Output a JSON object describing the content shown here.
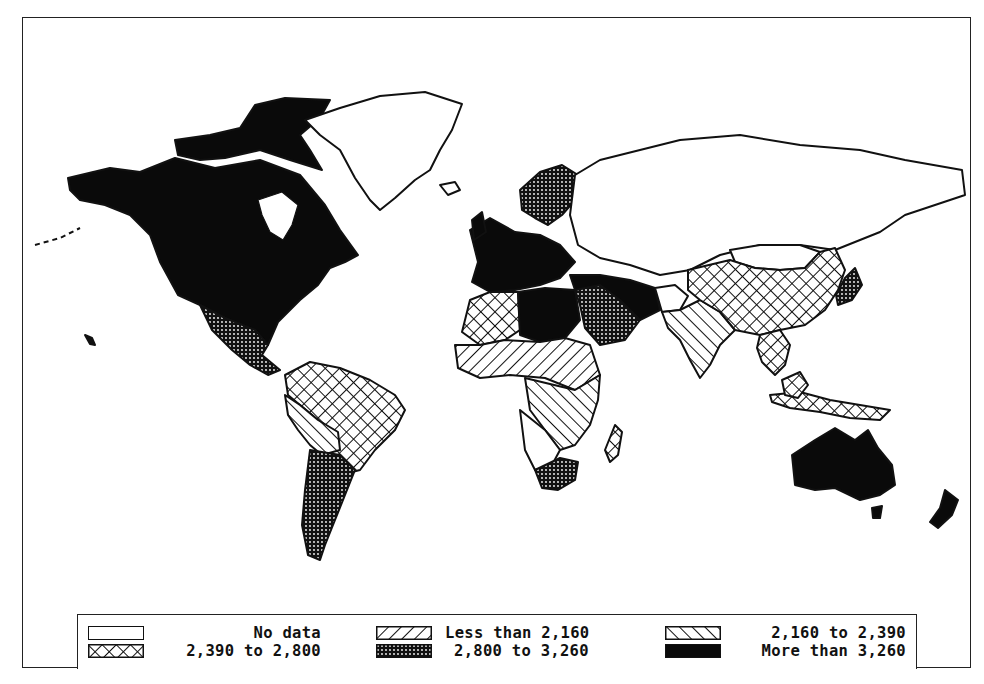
{
  "map": {
    "type": "choropleth",
    "projection": "world (Miller-like)",
    "regions": [
      {
        "name": "North America (USA, Canada)",
        "category": "more_than_3260"
      },
      {
        "name": "Mexico & Central America",
        "category": "2800_to_3260"
      },
      {
        "name": "Greenland",
        "category": "no_data"
      },
      {
        "name": "Northern South America / Brazil",
        "category": "2390_to_2800"
      },
      {
        "name": "Peru / Bolivia",
        "category": "2160_to_2390"
      },
      {
        "name": "Argentina / Chile",
        "category": "2800_to_3260"
      },
      {
        "name": "Western Europe",
        "category": "more_than_3260"
      },
      {
        "name": "Scandinavia",
        "category": "2800_to_3260"
      },
      {
        "name": "USSR",
        "category": "no_data"
      },
      {
        "name": "North Africa (Libya, Egypt)",
        "category": "more_than_3260"
      },
      {
        "name": "Northwest Africa",
        "category": "2390_to_2800"
      },
      {
        "name": "Sahel / West Africa",
        "category": "less_than_2160"
      },
      {
        "name": "Central / East Africa",
        "category": "2160_to_2390"
      },
      {
        "name": "Southern Africa (South Africa)",
        "category": "2800_to_3260"
      },
      {
        "name": "Madagascar",
        "category": "2390_to_2800"
      },
      {
        "name": "Middle East (Saudi Arabia)",
        "category": "2800_to_3260"
      },
      {
        "name": "Turkey / Iran",
        "category": "more_than_3260"
      },
      {
        "name": "Afghanistan",
        "category": "no_data"
      },
      {
        "name": "India / Pakistan",
        "category": "2160_to_2390"
      },
      {
        "name": "China",
        "category": "2390_to_2800"
      },
      {
        "name": "Mongolia",
        "category": "no_data"
      },
      {
        "name": "Japan",
        "category": "2800_to_3260"
      },
      {
        "name": "Southeast Asia / Indonesia",
        "category": "2390_to_2800"
      },
      {
        "name": "Australia",
        "category": "more_than_3260"
      },
      {
        "name": "New Zealand",
        "category": "more_than_3260"
      }
    ]
  },
  "legend": {
    "items": [
      {
        "key": "no_data",
        "label": "No data",
        "pattern": "blank"
      },
      {
        "key": "less_than_2160",
        "label": "Less than 2,160",
        "pattern": "diagonal-forward"
      },
      {
        "key": "2160_to_2390",
        "label": "2,160 to 2,390",
        "pattern": "diagonal-backward"
      },
      {
        "key": "2390_to_2800",
        "label": "2,390 to 2,800",
        "pattern": "crosshatch"
      },
      {
        "key": "2800_to_3260",
        "label": "2,800 to 3,260",
        "pattern": "dense-dots"
      },
      {
        "key": "more_than_3260",
        "label": "More than 3,260",
        "pattern": "solid-black"
      }
    ]
  },
  "colors": {
    "ink": "#111111",
    "background": "#ffffff"
  }
}
